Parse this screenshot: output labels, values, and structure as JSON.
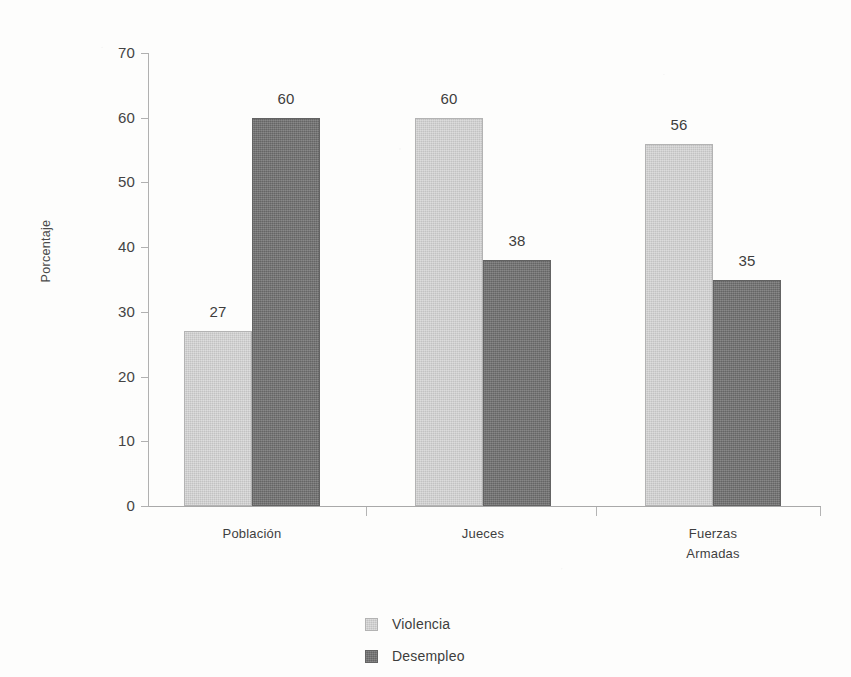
{
  "chart_data": {
    "type": "bar",
    "title": "",
    "subtitle": "",
    "xlabel": "",
    "ylabel": "Porcentaje",
    "categories": [
      "Población",
      "Jueces",
      "Fuerzas\nArmadas"
    ],
    "category_lines": [
      [
        "Población"
      ],
      [
        "Jueces"
      ],
      [
        "Fuerzas",
        "Armadas"
      ]
    ],
    "series": [
      {
        "name": "Violencia",
        "values": [
          27,
          60,
          56
        ],
        "color": "#c9c9c9"
      },
      {
        "name": "Desempleo",
        "values": [
          60,
          38,
          35
        ],
        "color": "#707070"
      }
    ],
    "ylim": [
      0,
      70
    ],
    "yticks": [
      0,
      10,
      20,
      30,
      40,
      50,
      60,
      70
    ],
    "ytick_labels": [
      "0",
      "10",
      "20",
      "30",
      "40",
      "50",
      "60",
      "70"
    ],
    "data_labels": [
      [
        "27",
        "60",
        "56"
      ],
      [
        "60",
        "38",
        "35"
      ]
    ],
    "grid": false,
    "legend_position": "bottom-center",
    "legend_entries": [
      "Violencia",
      "Desempleo"
    ],
    "background_color": "#fdfdfc",
    "axis_color": "#b0b0b0",
    "text_color": "#3d3d3d"
  }
}
